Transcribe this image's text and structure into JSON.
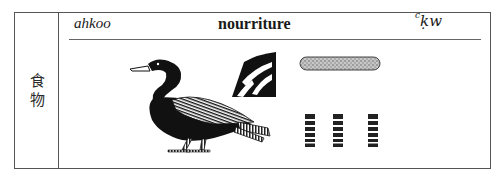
{
  "entry": {
    "chinese_label": "食物",
    "chinese_chars": [
      "食",
      "物"
    ],
    "transliteration": "ahkoo",
    "meaning": "nourriture",
    "egyptian": {
      "ayin": "c",
      "rest": "ḳw"
    }
  },
  "glyphs": [
    {
      "name": "bird-hieroglyph",
      "description": "duck/cormorant bird sign"
    },
    {
      "name": "tomb-ramp-hieroglyph",
      "description": "wavy stripes sign"
    },
    {
      "name": "bread-loaf-hieroglyph",
      "description": "stippled oblong bar"
    },
    {
      "name": "plural-strokes-hieroglyph",
      "description": "three striped vertical bars",
      "count": 3
    }
  ],
  "colors": {
    "ink": "#111111",
    "border": "#555555",
    "stipple": "#9a9a9a"
  }
}
